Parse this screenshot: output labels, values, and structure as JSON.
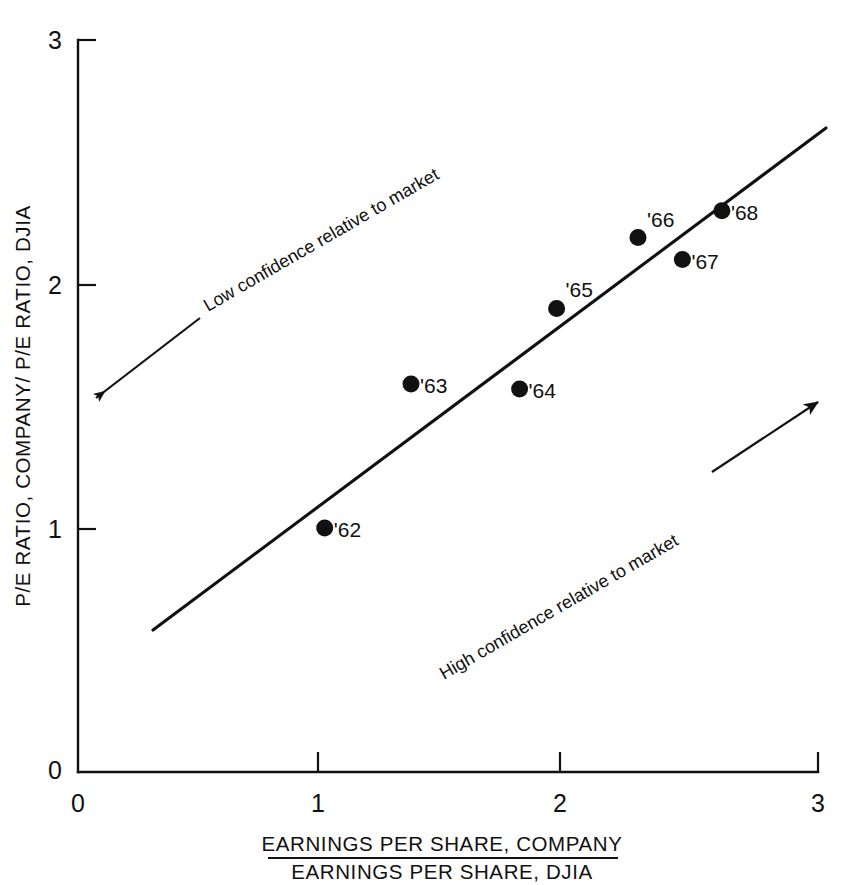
{
  "chart_data": {
    "type": "scatter",
    "title": "",
    "subtitle": "",
    "xlabel_numerator": "EARNINGS PER SHARE, COMPANY",
    "xlabel_denominator": "EARNINGS PER SHARE,  DJIA",
    "ylabel": "P/E RATIO, COMPANY/ P/E RATIO, DJIA",
    "xlim": [
      0,
      3
    ],
    "ylim": [
      0,
      3
    ],
    "xticks": [
      "0",
      "1",
      "2",
      "3"
    ],
    "xtick_values": [
      0,
      1,
      2,
      3
    ],
    "yticks": [
      "0",
      "1",
      "2",
      "3"
    ],
    "ytick_values": [
      0,
      1,
      2,
      3
    ],
    "grid": false,
    "legend": "none",
    "points": [
      {
        "label": "'62",
        "x": 1.0,
        "y": 1.0
      },
      {
        "label": "'63",
        "x": 1.35,
        "y": 1.59
      },
      {
        "label": "'64",
        "x": 1.79,
        "y": 1.57
      },
      {
        "label": "'65",
        "x": 1.94,
        "y": 1.9
      },
      {
        "label": "'66",
        "x": 2.27,
        "y": 2.19
      },
      {
        "label": "'67",
        "x": 2.45,
        "y": 2.1
      },
      {
        "label": "'68",
        "x": 2.61,
        "y": 2.3
      }
    ],
    "trendline": {
      "x1": 0.31,
      "y1": 0.58,
      "x2": 3.09,
      "y2": 2.64
    },
    "annotations": [
      {
        "id": "low-confidence",
        "text": "Low confidence relative to market",
        "direction": "down-left"
      },
      {
        "id": "high-confidence",
        "text": "High confidence relative to market",
        "direction": "up-right"
      }
    ]
  },
  "colors": {
    "ink": "#111111",
    "background": "#ffffff"
  }
}
